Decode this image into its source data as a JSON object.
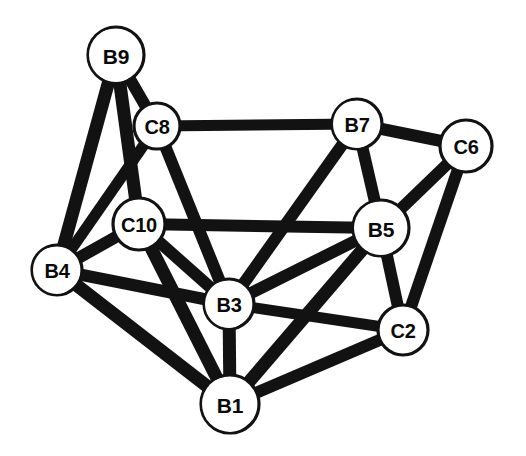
{
  "figure": {
    "kind": "molecular-structure-diagram",
    "title": "",
    "background_color": "#ffffff",
    "bond_color": "#121212",
    "atom_fill_color": "#ffffff",
    "atom_outline_color": "#121212",
    "label_color": "#0a0a0a",
    "width": 526,
    "height": 456
  },
  "atoms": [
    {
      "id": "B9",
      "label": "B9",
      "cx": 116,
      "cy": 55,
      "r": 28,
      "font_size": 21,
      "shaded": true,
      "shade_angle": 200
    },
    {
      "id": "C8",
      "label": "C8",
      "cx": 157,
      "cy": 126,
      "r": 23,
      "font_size": 20,
      "shaded": false,
      "shade_angle": 0
    },
    {
      "id": "B7",
      "label": "B7",
      "cx": 357,
      "cy": 124,
      "r": 25,
      "font_size": 20,
      "shaded": true,
      "shade_angle": 195
    },
    {
      "id": "C6",
      "label": "C6",
      "cx": 466,
      "cy": 146,
      "r": 26,
      "font_size": 20,
      "shaded": false,
      "shade_angle": 0
    },
    {
      "id": "C10",
      "label": "C10",
      "cx": 139,
      "cy": 224,
      "r": 26,
      "font_size": 20,
      "shaded": false,
      "shade_angle": 0
    },
    {
      "id": "B5",
      "label": "B5",
      "cx": 381,
      "cy": 228,
      "r": 28,
      "font_size": 21,
      "shaded": true,
      "shade_angle": 200
    },
    {
      "id": "B4",
      "label": "B4",
      "cx": 57,
      "cy": 270,
      "r": 25,
      "font_size": 20,
      "shaded": true,
      "shade_angle": 200
    },
    {
      "id": "B3",
      "label": "B3",
      "cx": 229,
      "cy": 304,
      "r": 25,
      "font_size": 20,
      "shaded": true,
      "shade_angle": 200
    },
    {
      "id": "C2",
      "label": "C2",
      "cx": 403,
      "cy": 330,
      "r": 25,
      "font_size": 20,
      "shaded": false,
      "shade_angle": 0
    },
    {
      "id": "B1",
      "label": "B1",
      "cx": 230,
      "cy": 404,
      "r": 29,
      "font_size": 21,
      "shaded": true,
      "shade_angle": 205
    }
  ],
  "bonds": [
    {
      "from": "B9",
      "to": "B4",
      "width": 13
    },
    {
      "from": "B9",
      "to": "C10",
      "width": 13
    },
    {
      "from": "B9",
      "to": "C8",
      "width": 12
    },
    {
      "from": "C8",
      "to": "B7",
      "width": 11
    },
    {
      "from": "C8",
      "to": "B4",
      "width": 11
    },
    {
      "from": "C8",
      "to": "B3",
      "width": 12
    },
    {
      "from": "B7",
      "to": "C6",
      "width": 12
    },
    {
      "from": "B7",
      "to": "B5",
      "width": 12
    },
    {
      "from": "B7",
      "to": "B3",
      "width": 12
    },
    {
      "from": "C6",
      "to": "B5",
      "width": 12
    },
    {
      "from": "C6",
      "to": "C2",
      "width": 12
    },
    {
      "from": "C10",
      "to": "B5",
      "width": 12
    },
    {
      "from": "C10",
      "to": "B4",
      "width": 12
    },
    {
      "from": "C10",
      "to": "B3",
      "width": 12
    },
    {
      "from": "C10",
      "to": "B1",
      "width": 13
    },
    {
      "from": "B5",
      "to": "C2",
      "width": 12
    },
    {
      "from": "B5",
      "to": "B3",
      "width": 12
    },
    {
      "from": "B5",
      "to": "B1",
      "width": 13
    },
    {
      "from": "B4",
      "to": "B3",
      "width": 12
    },
    {
      "from": "B4",
      "to": "B1",
      "width": 13
    },
    {
      "from": "B3",
      "to": "C2",
      "width": 11
    },
    {
      "from": "B3",
      "to": "B1",
      "width": 13
    },
    {
      "from": "C2",
      "to": "B1",
      "width": 12
    }
  ]
}
